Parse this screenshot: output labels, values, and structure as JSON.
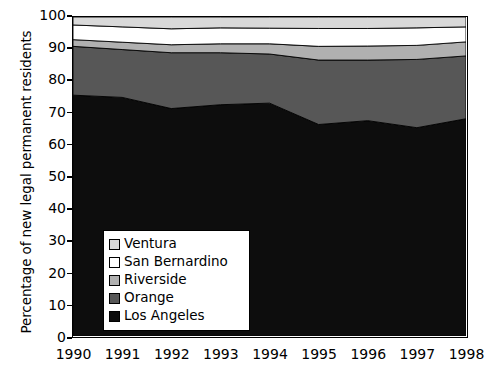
{
  "chart_data": {
    "type": "area",
    "stacked": true,
    "title": "",
    "xlabel": "",
    "ylabel": "Percentage of new legal permanent residents",
    "x": [
      1990,
      1991,
      1992,
      1993,
      1994,
      1995,
      1996,
      1997,
      1998
    ],
    "categories": [
      "1990",
      "1991",
      "1992",
      "1993",
      "1994",
      "1995",
      "1996",
      "1997",
      "1998"
    ],
    "xlim": [
      1990,
      1998
    ],
    "ylim": [
      0,
      100
    ],
    "yticks": [
      0,
      10,
      20,
      30,
      40,
      50,
      60,
      70,
      80,
      90,
      100
    ],
    "ytick_labels": [
      "0",
      "10",
      "20",
      "30",
      "40",
      "50",
      "60",
      "70",
      "80",
      "90",
      "100"
    ],
    "grid": false,
    "legend_position": "center-left-inside",
    "series": [
      {
        "name": "Los Angeles",
        "color": "#0d0d0d",
        "values": [
          75.5,
          74.8,
          71.3,
          72.5,
          73.0,
          66.3,
          67.5,
          65.3,
          68.1
        ]
      },
      {
        "name": "Orange",
        "color": "#575757",
        "values": [
          15.3,
          15.0,
          17.5,
          16.3,
          15.4,
          20.2,
          19.0,
          21.4,
          19.7
        ]
      },
      {
        "name": "Riverside",
        "color": "#b0b0b0",
        "values": [
          2.1,
          2.3,
          2.5,
          2.8,
          3.2,
          4.3,
          4.4,
          4.4,
          4.4
        ]
      },
      {
        "name": "San Bernardino",
        "color": "#ffffff",
        "values": [
          4.6,
          4.8,
          5.0,
          5.0,
          4.9,
          5.6,
          5.5,
          5.5,
          4.7
        ]
      },
      {
        "name": "Ventura",
        "color": "#d9d9d9",
        "values": [
          2.5,
          3.1,
          3.7,
          3.4,
          3.5,
          3.6,
          3.6,
          3.4,
          3.1
        ]
      }
    ]
  },
  "legend": {
    "items": [
      {
        "label": "Ventura",
        "color": "#d9d9d9"
      },
      {
        "label": "San Bernardino",
        "color": "#ffffff"
      },
      {
        "label": "Riverside",
        "color": "#b0b0b0"
      },
      {
        "label": "Orange",
        "color": "#575757"
      },
      {
        "label": "Los Angeles",
        "color": "#0d0d0d"
      }
    ]
  },
  "axes": {
    "y_title": "Percentage of new legal permanent residents",
    "y_labels": [
      "100",
      "90",
      "80",
      "70",
      "60",
      "50",
      "40",
      "30",
      "20",
      "10",
      "0"
    ],
    "x_labels": [
      "1990",
      "1991",
      "1992",
      "1993",
      "1994",
      "1995",
      "1996",
      "1997",
      "1998"
    ]
  },
  "colors": {
    "axis": "#000000",
    "background": "#ffffff"
  }
}
